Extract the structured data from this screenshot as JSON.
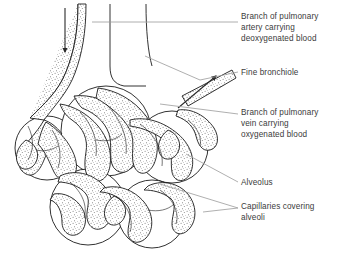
{
  "diagram": {
    "labels": [
      {
        "id": "artery",
        "text": "Branch of pulmonary\nartery carrying\ndeoxygenated blood",
        "name": "label-pulmonary-artery"
      },
      {
        "id": "bronchiole",
        "text": "Fine bronchiole",
        "name": "label-fine-bronchiole"
      },
      {
        "id": "vein",
        "text": "Branch of pulmonary\nvein carrying\noxygenated blood",
        "name": "label-pulmonary-vein"
      },
      {
        "id": "alveolus",
        "text": "Alveolus",
        "name": "label-alveolus"
      },
      {
        "id": "capillaries",
        "text": "Capillaries covering\nalveoli",
        "name": "label-capillaries"
      }
    ],
    "arrows": [
      {
        "id": "blood-in",
        "direction": "down",
        "meaning": "deoxygenated blood flowing in"
      },
      {
        "id": "blood-out",
        "direction": "up-right",
        "meaning": "oxygenated blood flowing out"
      }
    ],
    "colors": {
      "outline": "#1b1b1b",
      "stipple": "#6f6f6f",
      "leader_line": "#8c8c8c",
      "label_text": "#3b3b3b",
      "background": "#ffffff"
    }
  }
}
